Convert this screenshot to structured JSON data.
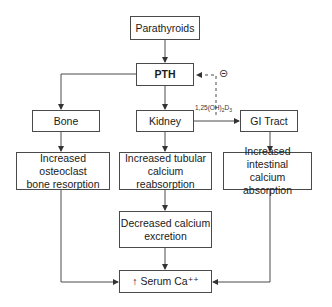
{
  "diagram": {
    "type": "flowchart",
    "nodes": {
      "parathyroids": "Parathyroids",
      "pth": "PTH",
      "bone": "Bone",
      "kidney": "Kidney",
      "gi_tract": "GI Tract",
      "bone_effect_1": "Increased osteoclast",
      "bone_effect_2": "bone resorption",
      "kidney_effect_1": "Increased tubular",
      "kidney_effect_2": "calcium reabsorption",
      "gi_effect_1": "Increased intestinal",
      "gi_effect_2": "calcium absorption",
      "excretion_1": "Decreased calcium",
      "excretion_2": "excretion",
      "serum": "↑ Serum Ca⁺⁺"
    },
    "edge_labels": {
      "vitamin_d_prefix": "1,25(OH)",
      "vitamin_d_sub1": "2",
      "vitamin_d_mid": "D",
      "vitamin_d_sub2": "3",
      "inhibition_symbol": "⊝"
    },
    "edges": [
      {
        "from": "Parathyroids",
        "to": "PTH",
        "style": "solid"
      },
      {
        "from": "PTH",
        "to": "Bone",
        "style": "solid"
      },
      {
        "from": "PTH",
        "to": "Kidney",
        "style": "solid"
      },
      {
        "from": "Kidney",
        "to": "GI Tract",
        "style": "solid",
        "label": "1,25(OH)2D3"
      },
      {
        "from": "1,25(OH)2D3",
        "to": "PTH",
        "style": "dashed",
        "effect": "inhibitory"
      },
      {
        "from": "Bone",
        "to": "Increased osteoclast bone resorption",
        "style": "solid"
      },
      {
        "from": "Kidney",
        "to": "Increased tubular calcium reabsorption",
        "style": "solid"
      },
      {
        "from": "GI Tract",
        "to": "Increased intestinal calcium absorption",
        "style": "solid"
      },
      {
        "from": "Increased tubular calcium reabsorption",
        "to": "Decreased calcium excretion",
        "style": "solid"
      },
      {
        "from": "Decreased calcium excretion",
        "to": "Serum Ca++",
        "style": "solid"
      },
      {
        "from": "Increased osteoclast bone resorption",
        "to": "Serum Ca++",
        "style": "solid"
      },
      {
        "from": "Increased intestinal calcium absorption",
        "to": "Serum Ca++",
        "style": "solid"
      }
    ],
    "colors": {
      "stroke": "#4a4a4a",
      "text": "#1a1a1a",
      "background": "#ffffff"
    }
  }
}
